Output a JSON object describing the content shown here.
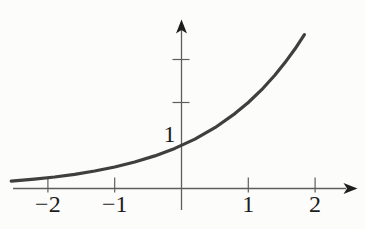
{
  "figure": {
    "colors": {
      "background": "#fcfcfb",
      "curve": "#3f3f3f",
      "axis": "#5e5e5e",
      "arrow": "#1e1e1e",
      "label": "#1c1c1c"
    }
  },
  "chart_data": {
    "type": "line",
    "title": "",
    "xlabel": "",
    "ylabel": "",
    "function": "y = 2^x",
    "grid": false,
    "legend": false,
    "xlim": [
      -2.7,
      2.7
    ],
    "ylim": [
      -0.9,
      3.9
    ],
    "series": [
      {
        "name": "exponential-curve",
        "points": [
          [
            -2.55,
            0.171
          ],
          [
            -2.2,
            0.218
          ],
          [
            -1.9,
            0.268
          ],
          [
            -1.6,
            0.33
          ],
          [
            -1.3,
            0.406
          ],
          [
            -1.0,
            0.5
          ],
          [
            -0.7,
            0.616
          ],
          [
            -0.4,
            0.758
          ],
          [
            -0.1,
            0.933
          ],
          [
            0.2,
            1.149
          ],
          [
            0.5,
            1.414
          ],
          [
            0.8,
            1.741
          ],
          [
            1.0,
            2.0
          ],
          [
            1.2,
            2.297
          ],
          [
            1.4,
            2.639
          ],
          [
            1.55,
            2.928
          ],
          [
            1.7,
            3.249
          ],
          [
            1.84,
            3.58
          ]
        ]
      }
    ],
    "x_ticks": [
      {
        "value": -2,
        "label": "−2"
      },
      {
        "value": -1,
        "label": "−1"
      },
      {
        "value": 1,
        "label": "1"
      },
      {
        "value": 2,
        "label": "2"
      }
    ],
    "y_ticks": [
      {
        "value": 1,
        "label": "1",
        "has_mark": false
      },
      {
        "value": 2,
        "label": "",
        "has_mark": true
      },
      {
        "value": 3,
        "label": "",
        "has_mark": true
      }
    ]
  }
}
